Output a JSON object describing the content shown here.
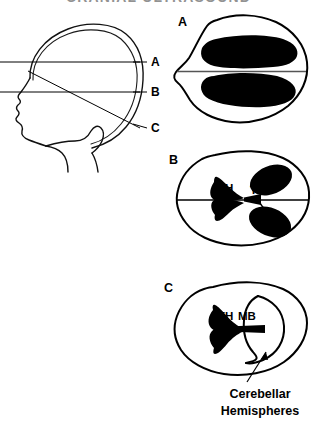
{
  "figure": {
    "title": "CRANIAL ULTRASOUND",
    "caption_cerebellar_line1": "Cerebellar",
    "caption_cerebellar_line2": "Hemispheres"
  },
  "head_profile": {
    "name": "lateral-head-profile",
    "section_labels": [
      {
        "id": "A",
        "label": "A",
        "y": 62
      },
      {
        "id": "B",
        "label": "B",
        "y": 92
      },
      {
        "id": "C",
        "label": "C",
        "y": 128
      }
    ]
  },
  "panels": [
    {
      "id": "A",
      "label": "A",
      "structures": []
    },
    {
      "id": "B",
      "label": "B",
      "structures": [
        {
          "abbr": "FH",
          "label": "FH"
        },
        {
          "abbr": "Th",
          "label": "Th"
        }
      ]
    },
    {
      "id": "C",
      "label": "C",
      "structures": [
        {
          "abbr": "FH",
          "label": "FH"
        },
        {
          "abbr": "MB",
          "label": "MB"
        }
      ]
    }
  ],
  "colors": {
    "background": "#ffffff",
    "ink": "#000000",
    "midline_gray": "#555555"
  }
}
